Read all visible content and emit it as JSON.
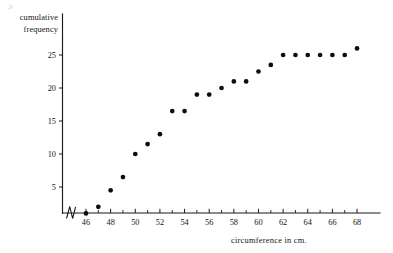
{
  "chart_data": {
    "type": "scatter",
    "title": "",
    "subtitle": "",
    "xlabel": "circumference in cm.",
    "ylabel": "cumulative frequency",
    "ylabel_lines": [
      "cumulative",
      "frequency"
    ],
    "x": [
      46,
      47,
      48,
      49,
      50,
      51,
      52,
      53,
      54,
      55,
      56,
      57,
      58,
      59,
      60,
      61,
      62,
      63,
      64,
      65,
      66,
      67,
      68
    ],
    "values": [
      1,
      2,
      4.5,
      6.5,
      10,
      11.5,
      13,
      16.5,
      16.5,
      19,
      19,
      20,
      21,
      21,
      22.5,
      23.5,
      25,
      25,
      25,
      25,
      25,
      25,
      26
    ],
    "xlim": [
      45,
      69.5
    ],
    "ylim": [
      0,
      27.5
    ],
    "xticks_major": [
      46,
      48,
      50,
      52,
      54,
      56,
      58,
      60,
      62,
      64,
      66,
      68
    ],
    "xticks_minor": [
      47,
      49,
      51,
      53,
      55,
      57,
      59,
      61,
      63,
      65,
      67
    ],
    "xtick_labels": [
      "46",
      "48",
      "50",
      "52",
      "54",
      "56",
      "58",
      "60",
      "62",
      "64",
      "66",
      "68"
    ],
    "yticks": [
      5,
      10,
      15,
      20,
      25
    ],
    "ytick_labels": [
      "5",
      "10",
      "15",
      "20",
      "25"
    ],
    "grid": false,
    "legend": false,
    "legend_position": "none",
    "axis_break": "x-axis broken between origin and 46",
    "marker": "filled-circle",
    "marker_color": "#0d0d0d",
    "axis_color": "#1a1a1a",
    "background_color": "#ffffff"
  }
}
